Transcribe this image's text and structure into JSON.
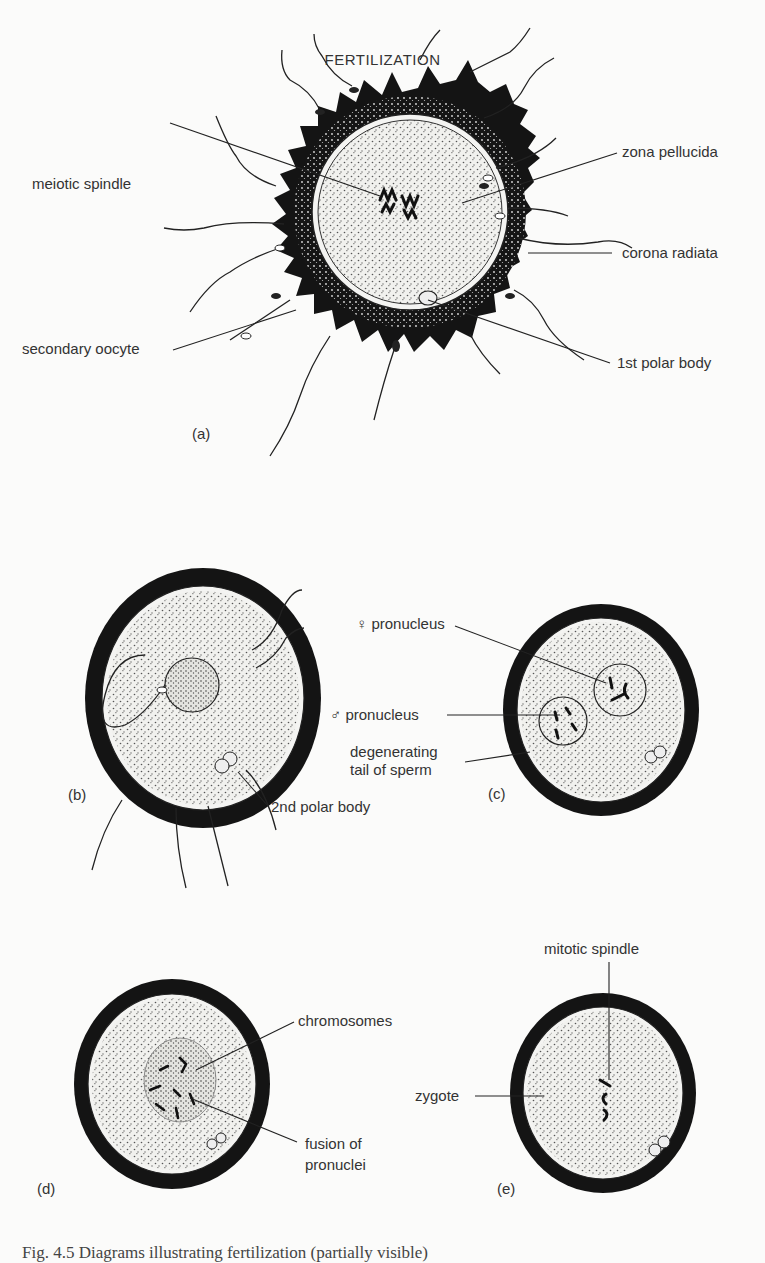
{
  "title": "FERTILIZATION",
  "panels": {
    "a": {
      "label": "(a)",
      "annotations": {
        "meiotic_spindle": "meiotic  spindle",
        "secondary_oocyte": "secondary oocyte",
        "zona_pellucida": "zona pellucida",
        "corona_radiata": "corona radiata",
        "first_polar_body": "1st polar body"
      }
    },
    "b": {
      "label": "(b)",
      "annotations": {
        "second_polar_body": "2nd polar body"
      }
    },
    "c": {
      "label": "(c)",
      "annotations": {
        "female_pronucleus": "♀ pronucleus",
        "male_pronucleus": "♂ pronucleus",
        "degenerating_tail_1": "degenerating",
        "degenerating_tail_2": "tail of sperm"
      }
    },
    "d": {
      "label": "(d)",
      "annotations": {
        "chromosomes": "chromosomes",
        "fusion_1": "fusion of",
        "fusion_2": "pronuclei"
      }
    },
    "e": {
      "label": "(e)",
      "annotations": {
        "mitotic_spindle": "mitotic spindle",
        "zygote": "zygote"
      }
    }
  },
  "caption": "Fig. 4.5  Diagrams illustrating fertilization (partially visible)"
}
